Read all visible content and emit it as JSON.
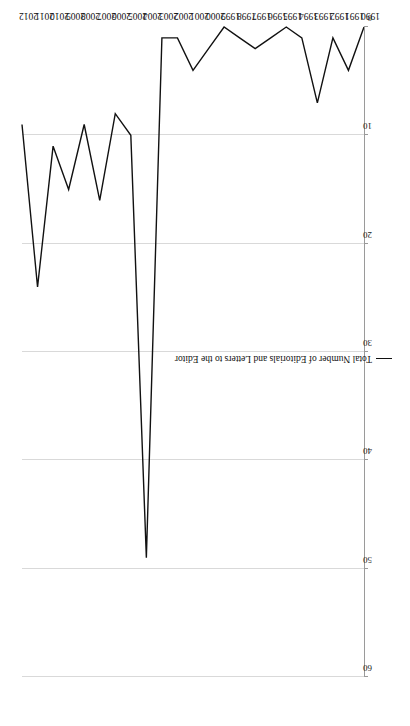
{
  "chart_data": {
    "type": "line",
    "title": "",
    "xlabel": "",
    "ylabel": "",
    "orientation": "rotated-90",
    "grid": true,
    "legend_position": "inside-right",
    "categories": [
      "1990",
      "1991",
      "1992",
      "1993",
      "1994",
      "1995",
      "1996",
      "1997",
      "1998",
      "1999",
      "2000",
      "2001",
      "2002",
      "2003",
      "2004",
      "2005",
      "2006",
      "2007",
      "2008",
      "2009",
      "2010",
      "2011",
      "2012"
    ],
    "series": [
      {
        "name": "Total Number of Editorials and Letters to the Editor",
        "color": "#111111",
        "values": [
          0,
          4,
          1,
          7,
          1,
          0,
          1,
          2,
          1,
          0,
          2,
          4,
          1,
          1,
          49,
          10,
          8,
          16,
          9,
          15,
          11,
          24,
          9
        ]
      }
    ],
    "ylim": [
      0,
      60
    ],
    "yticks": [
      0,
      10,
      20,
      30,
      40,
      50,
      60
    ],
    "ytick_labels": [
      "0",
      "10",
      "20",
      "30",
      "40",
      "50",
      "60"
    ],
    "xtick_labels": [
      "1990",
      "1991",
      "1992",
      "1993",
      "1994",
      "1995",
      "1996",
      "1997",
      "1998",
      "1999",
      "2000",
      "2001",
      "2002",
      "2003",
      "2004",
      "2005",
      "2006",
      "2007",
      "2008",
      "2009",
      "2010",
      "2011",
      "2012"
    ]
  },
  "legend": {
    "entries": [
      {
        "label": "Total Number of Editorials and Letters to the Editor",
        "color": "#111111"
      }
    ]
  },
  "colors": {
    "line": "#111111",
    "grid": "#d9d9d9",
    "axis": "#9a9a9a",
    "text": "#111111",
    "background": "#ffffff"
  }
}
